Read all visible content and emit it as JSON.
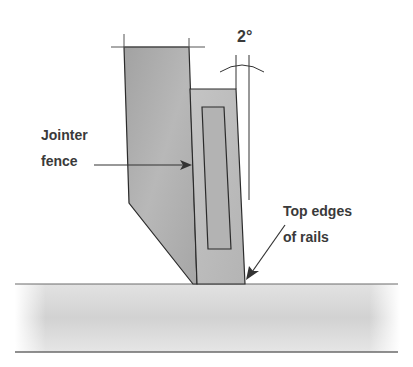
{
  "diagram": {
    "angle_label": "2°",
    "labels": {
      "fence_line1": "Jointer",
      "fence_line2": "fence",
      "rails_line1": "Top edges",
      "rails_line2": "of rails"
    },
    "colors": {
      "fence_fill": "#a9a9a9",
      "rail_fill": "#bdbdbd",
      "slot_fill": "#b3b3b3",
      "outline": "#2b2b2b",
      "ground": "#d6d6d6",
      "text": "#3a3a3a"
    }
  }
}
